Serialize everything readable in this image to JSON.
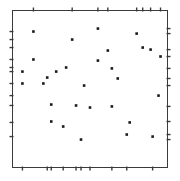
{
  "figure": {
    "title": "",
    "background_color": "#ffffff",
    "frame_color": "#3a3a3a",
    "point_color": "#1a1a1a",
    "tick_color": "#3a3a3a",
    "width_px": 180,
    "height_px": 181
  },
  "chart_data": {
    "type": "scatter",
    "title": "",
    "subtitle": "",
    "xlabel": "",
    "ylabel": "",
    "xlim": [
      0,
      1
    ],
    "ylim": [
      0,
      1
    ],
    "grid": false,
    "legend": null,
    "annotations": [],
    "marker": {
      "shape": "square",
      "size_px": 2.6,
      "color": "#1a1a1a"
    },
    "axis_style": {
      "frame": "full-box",
      "tick_style": "rug-marks-on-all-four-sides",
      "tick_length_px": 4,
      "tick_labels": [],
      "x_tick_labels": [],
      "y_tick_labels": []
    },
    "n_points": 30,
    "points": [
      {
        "x": 0.135,
        "y": 0.866
      },
      {
        "x": 0.385,
        "y": 0.815
      },
      {
        "x": 0.551,
        "y": 0.885
      },
      {
        "x": 0.801,
        "y": 0.853
      },
      {
        "x": 0.84,
        "y": 0.764
      },
      {
        "x": 0.891,
        "y": 0.751
      },
      {
        "x": 0.135,
        "y": 0.688
      },
      {
        "x": 0.551,
        "y": 0.681
      },
      {
        "x": 0.346,
        "y": 0.637
      },
      {
        "x": 0.641,
        "y": 0.631
      },
      {
        "x": 0.282,
        "y": 0.611
      },
      {
        "x": 0.224,
        "y": 0.573
      },
      {
        "x": 0.679,
        "y": 0.567
      },
      {
        "x": 0.199,
        "y": 0.535
      },
      {
        "x": 0.462,
        "y": 0.522
      },
      {
        "x": 0.942,
        "y": 0.458
      },
      {
        "x": 0.25,
        "y": 0.401
      },
      {
        "x": 0.41,
        "y": 0.395
      },
      {
        "x": 0.5,
        "y": 0.382
      },
      {
        "x": 0.641,
        "y": 0.389
      },
      {
        "x": 0.25,
        "y": 0.293
      },
      {
        "x": 0.756,
        "y": 0.287
      },
      {
        "x": 0.327,
        "y": 0.261
      },
      {
        "x": 0.737,
        "y": 0.21
      },
      {
        "x": 0.904,
        "y": 0.197
      },
      {
        "x": 0.442,
        "y": 0.178
      },
      {
        "x": 0.064,
        "y": 0.611
      },
      {
        "x": 0.064,
        "y": 0.535
      },
      {
        "x": 0.955,
        "y": 0.707
      },
      {
        "x": 0.615,
        "y": 0.745
      }
    ],
    "rug_ticks": {
      "top": [
        0.135,
        0.385,
        0.551,
        0.615,
        0.801,
        0.84,
        0.891,
        0.955
      ],
      "bottom": [
        0.064,
        0.224,
        0.25,
        0.327,
        0.41,
        0.442,
        0.5,
        0.641,
        0.737,
        0.904
      ],
      "left": [
        0.866,
        0.815,
        0.764,
        0.688,
        0.637,
        0.611,
        0.535,
        0.458,
        0.395,
        0.287,
        0.197
      ],
      "right": [
        0.885,
        0.853,
        0.751,
        0.707,
        0.631,
        0.567,
        0.522,
        0.389,
        0.293,
        0.21,
        0.178
      ]
    }
  }
}
